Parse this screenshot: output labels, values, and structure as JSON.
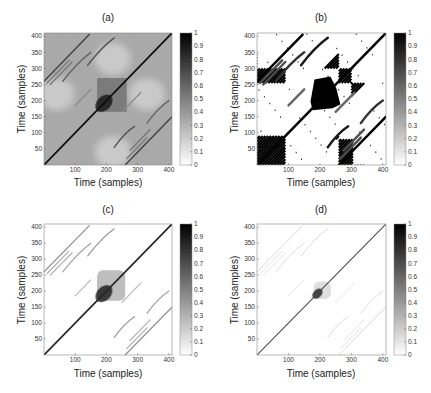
{
  "figure": {
    "panels_layout": "2x2 grid of recurrence-plot style heatmaps with grayscale colorbars"
  },
  "chart_data": [
    {
      "id": "a",
      "type": "heatmap",
      "title": "(a)",
      "xlabel": "Time (samples)",
      "ylabel": "Time (samples)",
      "xlim": [
        0,
        410
      ],
      "ylim": [
        0,
        410
      ],
      "xticks": [
        100,
        200,
        300,
        400
      ],
      "yticks": [
        50,
        100,
        150,
        200,
        250,
        300,
        350,
        400
      ],
      "colorbar": {
        "min": 0,
        "max": 1,
        "ticks": [
          "0",
          "0.1",
          "0.2",
          "0.3",
          "0.4",
          "0.5",
          "0.6",
          "0.7",
          "0.8",
          "0.9",
          "1"
        ],
        "colormap": "gray_reversed"
      },
      "background_level": 0.35,
      "central_block": {
        "x": [
          170,
          265
        ],
        "y": [
          165,
          270
        ],
        "level": 0.55
      },
      "diagonal_strength": 0.95,
      "stripe_strength": 0.75,
      "description": "Dense gray texture with strong main diagonal, parallel off-diagonal stripes, darker central block around 180-260"
    },
    {
      "id": "b",
      "type": "heatmap",
      "title": "(b)",
      "xlabel": "Time (samples)",
      "ylabel": "Time (samples)",
      "xlim": [
        0,
        410
      ],
      "ylim": [
        0,
        410
      ],
      "xticks": [
        100,
        200,
        300,
        400
      ],
      "yticks": [
        50,
        100,
        150,
        200,
        250,
        300,
        350,
        400
      ],
      "colorbar": {
        "min": 0,
        "max": 1,
        "ticks": [
          "0",
          "0.1",
          "0.2",
          "0.3",
          "0.4",
          "0.5",
          "0.6",
          "0.7",
          "0.8",
          "0.9",
          "1"
        ],
        "colormap": "gray_reversed"
      },
      "background_level": 0.0,
      "central_block": {
        "x": [
          170,
          265
        ],
        "y": [
          170,
          275
        ],
        "level": 1.0
      },
      "diagonal_strength": 1.0,
      "stripe_strength": 1.0,
      "description": "Binary thresholded plot: black diagonal stripes, solid black central block, hatched corner blocks near (0-90,0-90), (260-300,0-80), (0-90,260-300), (260-300,260-300)"
    },
    {
      "id": "c",
      "type": "heatmap",
      "title": "(c)",
      "xlabel": "Time (samples)",
      "ylabel": "Time (samples)",
      "xlim": [
        0,
        410
      ],
      "ylim": [
        0,
        410
      ],
      "xticks": [
        100,
        200,
        300,
        400
      ],
      "yticks": [
        50,
        100,
        150,
        200,
        250,
        300,
        350,
        400
      ],
      "colorbar": {
        "min": 0,
        "max": 1,
        "ticks": [
          "0",
          "0.1",
          "0.2",
          "0.3",
          "0.4",
          "0.5",
          "0.6",
          "0.7",
          "0.8",
          "0.9",
          "1"
        ],
        "colormap": "gray_reversed"
      },
      "background_level": 0.0,
      "central_block": {
        "x": [
          170,
          260
        ],
        "y": [
          170,
          265
        ],
        "level": 0.3
      },
      "diagonal_strength": 0.85,
      "stripe_strength": 0.45,
      "description": "Sparse plot: dark main diagonal, medium-gray off-diagonal stripes, light gray central patch with dark core near 190"
    },
    {
      "id": "d",
      "type": "heatmap",
      "title": "(d)",
      "xlabel": "Time (samples)",
      "ylabel": "Time (samples)",
      "xlim": [
        0,
        410
      ],
      "ylim": [
        0,
        410
      ],
      "xticks": [
        100,
        200,
        300,
        400
      ],
      "yticks": [
        50,
        100,
        150,
        200,
        250,
        300,
        350,
        400
      ],
      "colorbar": {
        "min": 0,
        "max": 1,
        "ticks": [
          "0",
          "0.1",
          "0.2",
          "0.3",
          "0.4",
          "0.5",
          "0.6",
          "0.7",
          "0.8",
          "0.9",
          "1"
        ],
        "colormap": "gray_reversed"
      },
      "background_level": 0.0,
      "central_block": {
        "x": [
          180,
          235
        ],
        "y": [
          175,
          230
        ],
        "level": 0.15
      },
      "diagonal_strength": 0.7,
      "stripe_strength": 0.2,
      "description": "Very sparse: thin main diagonal, faint off-diagonal stripes, small dark blob near (190,190)"
    }
  ]
}
